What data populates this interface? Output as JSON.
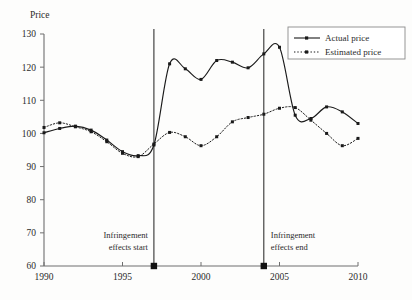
{
  "chart_data": {
    "type": "line",
    "title": "",
    "ylabel": "Price",
    "xlabel": "",
    "ylim": [
      60,
      130
    ],
    "xlim": [
      1990,
      2010
    ],
    "yticks": [
      60,
      70,
      80,
      90,
      100,
      110,
      120,
      130
    ],
    "xticks": [
      1990,
      1995,
      2000,
      2005,
      2010
    ],
    "ytick_labels": [
      "60",
      "70",
      "80",
      "90",
      "100",
      "110",
      "120",
      "130"
    ],
    "xtick_labels": [
      "1990",
      "1995",
      "2000",
      "2005",
      "2010"
    ],
    "grid": false,
    "legend_position": "top-right",
    "series": [
      {
        "name": "Actual price",
        "style": "solid",
        "color": "#1a1a1a",
        "x": [
          1990,
          1991,
          1992,
          1993,
          1994,
          1995,
          1996,
          1997,
          1998,
          1999,
          2000,
          2001,
          2002,
          2003,
          2004,
          2005,
          2006,
          2007,
          2008,
          2009,
          2010
        ],
        "values": [
          100.2,
          101.5,
          102.2,
          101.0,
          98.0,
          94.5,
          93.3,
          96.5,
          121.0,
          119.5,
          116.3,
          122.0,
          121.5,
          119.8,
          124.0,
          126.0,
          105.5,
          104.5,
          108.0,
          106.5,
          103.0
        ]
      },
      {
        "name": "Estimated price",
        "style": "dotted",
        "color": "#1a1a1a",
        "x": [
          1990,
          1991,
          1992,
          1993,
          1994,
          1995,
          1996,
          1997,
          1998,
          1999,
          2000,
          2001,
          2002,
          2003,
          2004,
          2005,
          2006,
          2007,
          2008,
          2009,
          2010
        ],
        "values": [
          101.8,
          103.2,
          102.0,
          100.5,
          97.5,
          94.0,
          93.0,
          96.8,
          100.3,
          99.0,
          96.3,
          99.0,
          103.5,
          104.8,
          105.8,
          107.6,
          107.8,
          104.0,
          100.0,
          96.3,
          98.5
        ]
      }
    ],
    "annotations": [
      {
        "label": "Infringement effects start",
        "line1": "Infringement",
        "line2": "effects start",
        "x": 1997
      },
      {
        "label": "Infringement effects end",
        "line1": "Infringement",
        "line2": "effects end",
        "x": 2004
      }
    ],
    "markers": [
      {
        "name": "infringement-start-marker",
        "x": 1997,
        "y": 60
      },
      {
        "name": "infringement-end-marker",
        "x": 2004,
        "y": 60
      }
    ]
  },
  "legend": {
    "entries": [
      {
        "label": "Actual price"
      },
      {
        "label": "Estimated price"
      }
    ]
  }
}
